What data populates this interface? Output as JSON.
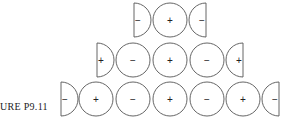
{
  "caption": "URE P9.11",
  "figure": {
    "radius": 17,
    "stroke_color": "#555555",
    "rows": [
      {
        "cy": 20,
        "left_half": {
          "flat_x": 134,
          "sign": "−"
        },
        "circles": [
          {
            "cx": 170,
            "sign": "+"
          }
        ],
        "right_half": {
          "flat_x": 206,
          "sign": "−"
        }
      },
      {
        "cy": 60,
        "left_half": {
          "flat_x": 97,
          "sign": "+"
        },
        "circles": [
          {
            "cx": 133,
            "sign": "−"
          },
          {
            "cx": 170,
            "sign": "+"
          },
          {
            "cx": 207,
            "sign": "−"
          }
        ],
        "right_half": {
          "flat_x": 243,
          "sign": "+"
        }
      },
      {
        "cy": 99,
        "left_half": {
          "flat_x": 61,
          "sign": "−"
        },
        "circles": [
          {
            "cx": 96,
            "sign": "+"
          },
          {
            "cx": 133,
            "sign": "−"
          },
          {
            "cx": 170,
            "sign": "+"
          },
          {
            "cx": 207,
            "sign": "−"
          },
          {
            "cx": 243,
            "sign": "+"
          }
        ],
        "right_half": {
          "flat_x": 279,
          "sign": "−"
        }
      }
    ]
  }
}
